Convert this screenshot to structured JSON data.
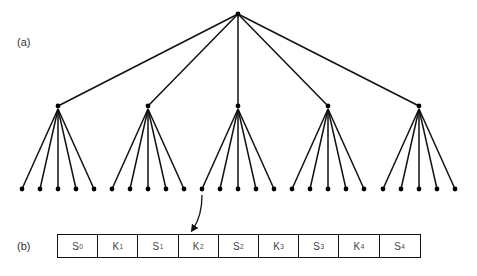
{
  "labels": {
    "a": "(a)",
    "b": "(b)"
  },
  "tree": {
    "root": {
      "x": 238,
      "y": 14
    },
    "level1": [
      {
        "x": 58,
        "y": 106
      },
      {
        "x": 148,
        "y": 106
      },
      {
        "x": 238,
        "y": 106
      },
      {
        "x": 328,
        "y": 106
      },
      {
        "x": 419,
        "y": 106
      }
    ],
    "children_per_node": 5,
    "leaf_offsets": [
      -36,
      -18,
      0,
      18,
      36
    ],
    "leaf_y": 189,
    "line_color": "#111111"
  },
  "arrow": {
    "from_leaf": {
      "group": 2,
      "index": 0
    },
    "start": [
      202,
      195
    ],
    "end": [
      193,
      229
    ]
  },
  "array": {
    "cells": [
      {
        "base": "S",
        "sub": "0"
      },
      {
        "base": "K",
        "sub": "1"
      },
      {
        "base": "S",
        "sub": "1"
      },
      {
        "base": "K",
        "sub": "2"
      },
      {
        "base": "S",
        "sub": "2"
      },
      {
        "base": "K",
        "sub": "3"
      },
      {
        "base": "S",
        "sub": "3"
      },
      {
        "base": "K",
        "sub": "4"
      },
      {
        "base": "S",
        "sub": "4"
      }
    ]
  }
}
